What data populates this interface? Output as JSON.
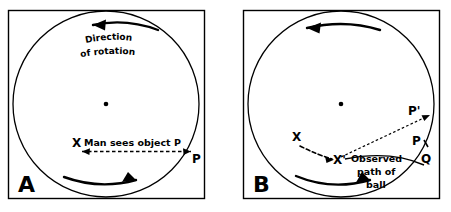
{
  "figure": {
    "background_color": "#ffffff",
    "ink_color": "#000000",
    "width": 451,
    "height": 212
  },
  "panels": [
    {
      "id": "A",
      "letter": "A",
      "frame": {
        "x": 8,
        "y": 10,
        "width": 197,
        "height": 189
      },
      "circle": {
        "cx": 106,
        "cy": 104,
        "r": 93
      },
      "center_dot": {
        "cx": 106,
        "cy": 104,
        "r": 2
      },
      "curved_labels": [
        {
          "name": "direction-of-rotation-line1",
          "text": "Direction"
        },
        {
          "name": "direction-of-rotation-line2",
          "text": "of  rotation"
        }
      ],
      "point_labels": [
        {
          "name": "observer-marker-x",
          "text": "X",
          "x": 76,
          "y": 143
        },
        {
          "name": "point-label-p",
          "text": "P",
          "x": 196,
          "y": 158
        }
      ],
      "annotations": [
        {
          "name": "man-sees-object-caption",
          "text": "Man sees object P"
        }
      ],
      "arrows": [
        {
          "name": "rotation-arrow-top",
          "direction": "counterclockwise-left"
        },
        {
          "name": "rotation-arrow-bottom",
          "direction": "counterclockwise-right"
        },
        {
          "name": "line-of-sight-arrow",
          "style": "dashed",
          "from": "X",
          "to": "P"
        }
      ]
    },
    {
      "id": "B",
      "letter": "B",
      "frame": {
        "x": 243,
        "y": 10,
        "width": 197,
        "height": 189
      },
      "circle": {
        "cx": 341,
        "cy": 104,
        "r": 93
      },
      "center_dot": {
        "cx": 341,
        "cy": 104,
        "r": 2
      },
      "point_labels": [
        {
          "name": "point-label-x",
          "text": "X",
          "x": 296,
          "y": 137
        },
        {
          "name": "point-label-x-prime",
          "text": "X'",
          "x": 337,
          "y": 158
        },
        {
          "name": "point-label-p-prime",
          "text": "P'",
          "x": 413,
          "y": 111
        },
        {
          "name": "point-label-p",
          "text": "P",
          "x": 417,
          "y": 141
        },
        {
          "name": "point-label-q",
          "text": "Q",
          "x": 425,
          "y": 158
        }
      ],
      "annotations": [
        {
          "name": "observed-path-line1",
          "text": "Observed"
        },
        {
          "name": "observed-path-line2",
          "text": "path of"
        },
        {
          "name": "observed-path-line3",
          "text": "ball"
        }
      ],
      "arrows": [
        {
          "name": "rotation-arrow-top",
          "direction": "counterclockwise-left"
        },
        {
          "name": "rotation-arrow-bottom",
          "direction": "counterclockwise-right"
        },
        {
          "name": "observer-motion-arrow",
          "style": "dashed",
          "from": "X",
          "to": "X'"
        },
        {
          "name": "line-of-sight-arrow",
          "style": "dotted",
          "from": "X'",
          "to": "P'"
        },
        {
          "name": "observed-path-curve",
          "style": "solid",
          "from": "X'",
          "to": "Q"
        }
      ]
    }
  ]
}
